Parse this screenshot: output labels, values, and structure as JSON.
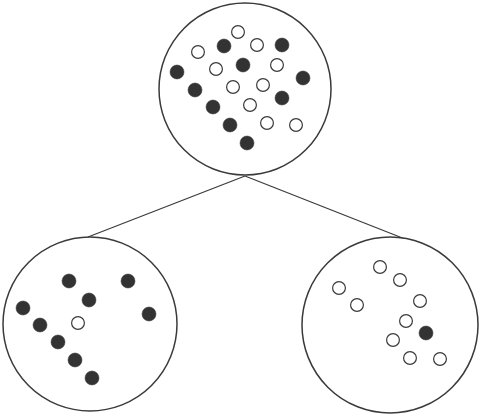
{
  "diagram": {
    "title": "",
    "colors": {
      "background": "#ffffff",
      "stroke": "#3a3a3a",
      "filled": "#333333",
      "open_fill": "#ffffff"
    },
    "point_radius": 7,
    "nodes": [
      {
        "id": "root",
        "cx": 245,
        "cy": 89,
        "r": 86,
        "points": [
          {
            "x": 238,
            "y": 32,
            "type": "open"
          },
          {
            "x": 198,
            "y": 52,
            "type": "open"
          },
          {
            "x": 224,
            "y": 46,
            "type": "filled"
          },
          {
            "x": 257,
            "y": 45,
            "type": "open"
          },
          {
            "x": 282,
            "y": 45,
            "type": "filled"
          },
          {
            "x": 177,
            "y": 72,
            "type": "filled"
          },
          {
            "x": 216,
            "y": 69,
            "type": "open"
          },
          {
            "x": 243,
            "y": 65,
            "type": "filled"
          },
          {
            "x": 277,
            "y": 65,
            "type": "open"
          },
          {
            "x": 303,
            "y": 78,
            "type": "filled"
          },
          {
            "x": 195,
            "y": 90,
            "type": "filled"
          },
          {
            "x": 233,
            "y": 87,
            "type": "open"
          },
          {
            "x": 263,
            "y": 85,
            "type": "open"
          },
          {
            "x": 282,
            "y": 98,
            "type": "filled"
          },
          {
            "x": 213,
            "y": 107,
            "type": "filled"
          },
          {
            "x": 250,
            "y": 105,
            "type": "open"
          },
          {
            "x": 230,
            "y": 125,
            "type": "filled"
          },
          {
            "x": 267,
            "y": 123,
            "type": "open"
          },
          {
            "x": 296,
            "y": 125,
            "type": "open"
          },
          {
            "x": 247,
            "y": 143,
            "type": "filled"
          }
        ]
      },
      {
        "id": "left-child",
        "cx": 90,
        "cy": 324,
        "r": 87,
        "points": [
          {
            "x": 69,
            "y": 281,
            "type": "filled"
          },
          {
            "x": 128,
            "y": 281,
            "type": "filled"
          },
          {
            "x": 89,
            "y": 300,
            "type": "filled"
          },
          {
            "x": 23,
            "y": 308,
            "type": "filled"
          },
          {
            "x": 149,
            "y": 314,
            "type": "filled"
          },
          {
            "x": 40,
            "y": 325,
            "type": "filled"
          },
          {
            "x": 78,
            "y": 323,
            "type": "open"
          },
          {
            "x": 58,
            "y": 342,
            "type": "filled"
          },
          {
            "x": 75,
            "y": 360,
            "type": "filled"
          },
          {
            "x": 92,
            "y": 378,
            "type": "filled"
          }
        ]
      },
      {
        "id": "right-child",
        "cx": 390,
        "cy": 325,
        "r": 88,
        "points": [
          {
            "x": 380,
            "y": 267,
            "type": "open"
          },
          {
            "x": 400,
            "y": 280,
            "type": "open"
          },
          {
            "x": 339,
            "y": 288,
            "type": "open"
          },
          {
            "x": 357,
            "y": 305,
            "type": "open"
          },
          {
            "x": 420,
            "y": 301,
            "type": "open"
          },
          {
            "x": 406,
            "y": 321,
            "type": "open"
          },
          {
            "x": 426,
            "y": 333,
            "type": "filled"
          },
          {
            "x": 393,
            "y": 340,
            "type": "open"
          },
          {
            "x": 410,
            "y": 358,
            "type": "open"
          },
          {
            "x": 440,
            "y": 359,
            "type": "open"
          }
        ]
      }
    ],
    "edges": [
      {
        "from": "root",
        "to": "left-child",
        "x1": 245,
        "y1": 176,
        "x2": 88,
        "y2": 237
      },
      {
        "from": "root",
        "to": "right-child",
        "x1": 245,
        "y1": 176,
        "x2": 405,
        "y2": 239
      }
    ]
  }
}
